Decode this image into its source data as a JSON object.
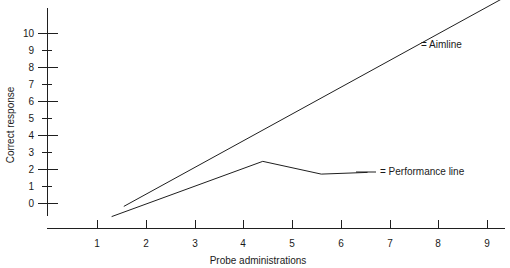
{
  "chart_data": {
    "type": "line",
    "title": "",
    "xlabel": "Probe administrations",
    "ylabel": "Correct response",
    "xlim": [
      0.4,
      9.5
    ],
    "ylim": [
      -0.6,
      11.6
    ],
    "grid": false,
    "legend_position": "inside-right",
    "x_ticks": [
      "1",
      "2",
      "3",
      "4",
      "5",
      "6",
      "7",
      "8",
      "9"
    ],
    "x_tick_values": [
      1,
      2,
      3,
      4,
      5,
      6,
      7,
      8,
      9
    ],
    "y_ticks": [
      "0",
      "1",
      "2",
      "3",
      "4",
      "5",
      "6",
      "7",
      "8",
      "9",
      "10"
    ],
    "y_tick_values": [
      0,
      1,
      2,
      3,
      4,
      5,
      6,
      7,
      8,
      9,
      10
    ],
    "y_major_tick_values": [
      0,
      2,
      4,
      6,
      8,
      10
    ],
    "series": [
      {
        "name": "Aimline",
        "legend_label": "= Aimline",
        "points": [
          {
            "x": 1.55,
            "y": -0.2
          },
          {
            "x": 9.3,
            "y": 12.0
          }
        ]
      },
      {
        "name": "Performance line",
        "legend_label": "= Performance line",
        "points": [
          {
            "x": 1.3,
            "y": -0.8
          },
          {
            "x": 4.4,
            "y": 2.45
          },
          {
            "x": 5.6,
            "y": 1.7
          },
          {
            "x": 6.55,
            "y": 1.8
          }
        ]
      }
    ],
    "annotations": [
      {
        "name": "aimline-legend",
        "text": "= Aimline",
        "x": 8.05,
        "y": 9.3
      },
      {
        "name": "performance-legend",
        "text": "= Performance line",
        "x": 6.95,
        "y": 1.85
      }
    ]
  }
}
